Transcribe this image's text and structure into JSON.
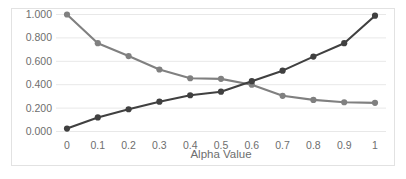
{
  "chart_data": {
    "type": "line",
    "title": "",
    "xlabel": "Alpha Value",
    "ylabel": "",
    "x": [
      0,
      0.1,
      0.2,
      0.3,
      0.4,
      0.5,
      0.6,
      0.7,
      0.8,
      0.9,
      1
    ],
    "x_tick_labels": [
      "0",
      "0.1",
      "0.2",
      "0.3",
      "0.4",
      "0.5",
      "0.6",
      "0.7",
      "0.8",
      "0.9",
      "1"
    ],
    "y_tick_labels": [
      "1.000",
      "0.800",
      "0.600",
      "0.400",
      "0.200",
      "0.000"
    ],
    "y_tick_values": [
      1.0,
      0.8,
      0.6,
      0.4,
      0.2,
      0.0
    ],
    "xlim": [
      0,
      1
    ],
    "ylim": [
      0,
      1
    ],
    "grid": "horizontal",
    "legend": "none",
    "series": [
      {
        "name": "descending-series",
        "color": "#808080",
        "marker": "circle",
        "values": [
          1.0,
          0.755,
          0.645,
          0.53,
          0.455,
          0.45,
          0.4,
          0.305,
          0.27,
          0.25,
          0.245
        ]
      },
      {
        "name": "ascending-series",
        "color": "#404040",
        "marker": "circle",
        "values": [
          0.025,
          0.12,
          0.19,
          0.255,
          0.31,
          0.34,
          0.43,
          0.52,
          0.64,
          0.755,
          0.99
        ]
      }
    ],
    "colors": {
      "grid": "#e8e8e8",
      "frame": "#e2e2e2",
      "tick_text": "#6e6e6e",
      "background": "#ffffff"
    }
  }
}
